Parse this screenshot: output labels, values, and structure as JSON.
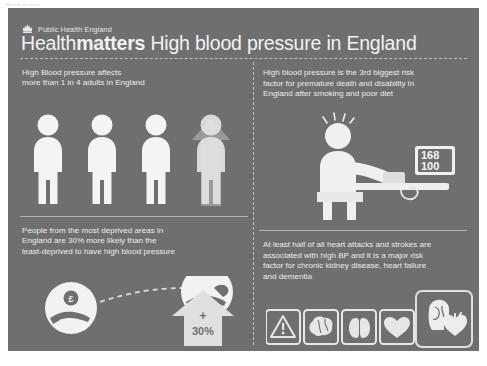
{
  "topstrip": {
    "text": "Health matters"
  },
  "poster": {
    "background_color": "#6f6f6f",
    "text_color": "#ececec",
    "accent_color": "#f2f2f2"
  },
  "header": {
    "brand": "Public Health England",
    "crown_icon": "crown-icon",
    "title_light": "Health",
    "title_bold": "matters",
    "title_rest": " High blood pressure in England"
  },
  "quadrants": {
    "top_left": {
      "text": "High Blood pressure affects more than 1 in 4 adults in England",
      "line1": "High Blood pressure affects",
      "line2": "more than 1 in 4 adults in England",
      "figures_total": 4,
      "figures_highlighted": 1,
      "illustration": "four-person-figures-with-up-arrow"
    },
    "top_right": {
      "line1": "High blood pressure is the 3rd biggest risk",
      "line2": "factor for premature death and disability in",
      "line3": "England after smoking and poor diet",
      "illustration": "seated-patient-with-bp-monitor",
      "monitor": {
        "systolic": "168",
        "diastolic": "100"
      }
    },
    "bottom_left": {
      "line1": "People from the most deprived areas in",
      "line2": "England are 30% more likely than the",
      "line3": "least-deprived to have high blood pressure",
      "illustration": "hands-with-coin-and-increase-arrow",
      "coin_symbol": "£",
      "arrow_plus": "+",
      "arrow_value": "30%"
    },
    "bottom_right": {
      "line1": "At least half of all heart attacks and strokes are",
      "line2": "associated with high BP and it is a major risk",
      "line3": "factor for chronic kidney disease, heart failure",
      "line4": "and dementia",
      "icons": [
        {
          "name": "warning-triangle-icon",
          "label": "warning"
        },
        {
          "name": "brain-icon",
          "label": "brain"
        },
        {
          "name": "kidneys-icon",
          "label": "kidneys"
        },
        {
          "name": "heart-icon",
          "label": "heart"
        }
      ],
      "feature_icon": {
        "name": "head-brain-heart-icon",
        "label": "dementia and heart"
      }
    }
  }
}
